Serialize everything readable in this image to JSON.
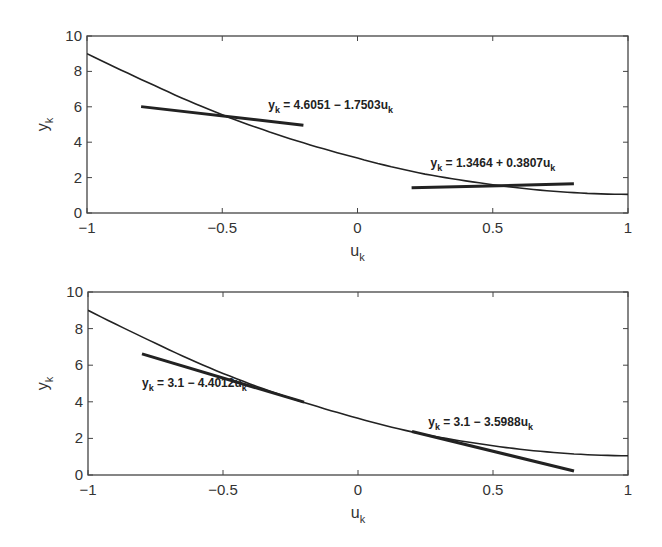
{
  "chart_data": [
    {
      "type": "line",
      "panel": "top",
      "title": "",
      "xlabel": "u_k",
      "ylabel": "y_k",
      "xlim": [
        -1,
        1
      ],
      "ylim": [
        0,
        10
      ],
      "xticks": [
        -1,
        -0.5,
        0,
        0.5,
        1
      ],
      "xtick_labels": [
        "−1",
        "−0.5",
        "0",
        "0.5",
        "1"
      ],
      "yticks": [
        0,
        2,
        4,
        6,
        8,
        10
      ],
      "ytick_labels": [
        "0",
        "2",
        "4",
        "6",
        "8",
        "10"
      ],
      "grid": false,
      "legend": null,
      "series": [
        {
          "name": "nonlinear curve",
          "style": "thin",
          "x": [
            -1,
            -0.75,
            -0.5,
            -0.25,
            0,
            0.25,
            0.5,
            0.75,
            1
          ],
          "values": [
            9.0,
            7.2,
            5.55,
            4.2,
            3.1,
            2.2,
            1.6,
            1.2,
            1.05
          ]
        },
        {
          "name": "y_k = 4.6051 − 1.7503u_k",
          "style": "thick",
          "x": [
            -0.8,
            -0.2
          ],
          "values": [
            6.01,
            4.96
          ]
        },
        {
          "name": "y_k = 1.3464 + 0.3807u_k",
          "style": "thick",
          "x": [
            0.2,
            0.8
          ],
          "values": [
            1.42,
            1.65
          ]
        }
      ],
      "annotations": [
        {
          "text_main": "y",
          "text_sub": "k",
          "text_rest": " = 4.6051 − 1.7503u",
          "text_sub2": "k",
          "x": -0.33,
          "y": 5.9
        },
        {
          "text_main": "y",
          "text_sub": "k",
          "text_rest": " = 1.3464 + 0.3807u",
          "text_sub2": "k",
          "x": 0.27,
          "y": 2.6
        }
      ]
    },
    {
      "type": "line",
      "panel": "bottom",
      "title": "",
      "xlabel": "u_k",
      "ylabel": "y_k",
      "xlim": [
        -1,
        1
      ],
      "ylim": [
        0,
        10
      ],
      "xticks": [
        -1,
        -0.5,
        0,
        0.5,
        1
      ],
      "xtick_labels": [
        "−1",
        "−0.5",
        "0",
        "0.5",
        "1"
      ],
      "yticks": [
        0,
        2,
        4,
        6,
        8,
        10
      ],
      "ytick_labels": [
        "0",
        "2",
        "4",
        "6",
        "8",
        "10"
      ],
      "grid": false,
      "legend": null,
      "series": [
        {
          "name": "nonlinear curve",
          "style": "thin",
          "x": [
            -1,
            -0.75,
            -0.5,
            -0.25,
            0,
            0.25,
            0.5,
            0.75,
            1
          ],
          "values": [
            9.0,
            7.2,
            5.55,
            4.2,
            3.1,
            2.2,
            1.6,
            1.2,
            1.05
          ]
        },
        {
          "name": "y_k = 3.1 − 4.4012u_k",
          "style": "thick",
          "x": [
            -0.8,
            -0.2
          ],
          "values": [
            6.62,
            3.98
          ]
        },
        {
          "name": "y_k = 3.1 − 3.5988u_k",
          "style": "thick",
          "x": [
            0.2,
            0.8
          ],
          "values": [
            2.38,
            0.22
          ]
        }
      ],
      "annotations": [
        {
          "text_main": "y",
          "text_sub": "k",
          "text_rest": " = 3.1 − 4.4012u",
          "text_sub2": "k",
          "x": -0.8,
          "y": 4.8
        },
        {
          "text_main": "y",
          "text_sub": "k",
          "text_rest": " = 3.1 − 3.5988u",
          "text_sub2": "k",
          "x": 0.26,
          "y": 2.7
        }
      ]
    }
  ],
  "labels": {
    "x_main": "u",
    "x_sub": "k",
    "y_main": "y",
    "y_sub": "k"
  }
}
